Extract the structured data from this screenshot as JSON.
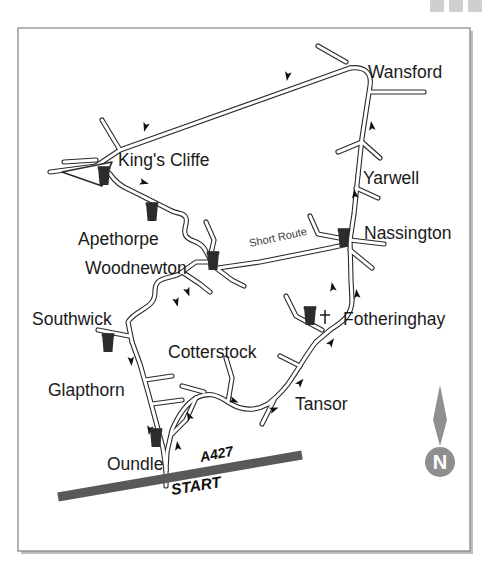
{
  "page": {
    "background_color": "#ffffff"
  },
  "decorations": {
    "top_bars": [
      {
        "name": "gray-bar-1",
        "color": "#cfcfcf"
      },
      {
        "name": "gray-bar-2",
        "color": "#cfcfcf"
      },
      {
        "name": "gray-bar-3",
        "color": "#cfcfcf"
      }
    ],
    "frame": {
      "border_color": "#8a8a8a",
      "shadow_color": "#bdbdbd"
    }
  },
  "map": {
    "frame_label": "map-frame",
    "road_color": "#2b2b2b",
    "road_fill": "#ffffff",
    "pub_symbol_color": "#2e2b2b",
    "main_road_color": "#595959",
    "places": [
      {
        "id": "wansford",
        "label": "Wansford",
        "x": 368,
        "y": 78,
        "anchor": "start"
      },
      {
        "id": "kings-cliffe",
        "label": "King's Cliffe",
        "x": 118,
        "y": 166,
        "anchor": "start"
      },
      {
        "id": "yarwell",
        "label": "Yarwell",
        "x": 363,
        "y": 184,
        "anchor": "start"
      },
      {
        "id": "apethorpe",
        "label": "Apethorpe",
        "x": 78,
        "y": 245,
        "anchor": "start"
      },
      {
        "id": "nassington",
        "label": "Nassington",
        "x": 364,
        "y": 239,
        "anchor": "start"
      },
      {
        "id": "woodnewton",
        "label": "Woodnewton",
        "x": 85,
        "y": 274,
        "anchor": "start"
      },
      {
        "id": "southwick",
        "label": "Southwick",
        "x": 32,
        "y": 325,
        "anchor": "start"
      },
      {
        "id": "fotheringhay",
        "label": "Fotheringhay",
        "x": 343,
        "y": 325,
        "anchor": "start"
      },
      {
        "id": "cotterstock",
        "label": "Cotterstock",
        "x": 168,
        "y": 358,
        "anchor": "start"
      },
      {
        "id": "glapthorn",
        "label": "Glapthorn",
        "x": 48,
        "y": 396,
        "anchor": "start"
      },
      {
        "id": "tansor",
        "label": "Tansor",
        "x": 295,
        "y": 410,
        "anchor": "start"
      },
      {
        "id": "oundle",
        "label": "Oundle",
        "x": 107,
        "y": 470,
        "anchor": "start"
      }
    ],
    "annotations": {
      "short_route": {
        "label": "Short Route",
        "x": 250,
        "y": 247,
        "rotate": -12
      },
      "a427": {
        "label": "A427",
        "x": 201,
        "y": 462,
        "rotate": -11
      },
      "start": {
        "label": "START",
        "x": 172,
        "y": 495,
        "rotate": -9
      }
    },
    "compass": {
      "name": "north-compass",
      "letter": "N",
      "needle_color": "#8f8f8f",
      "circle_color": "#8f8f8f",
      "x": 440,
      "y": 430
    },
    "pubs": [
      {
        "id": "pub-kings-cliffe",
        "x": 104,
        "y": 178
      },
      {
        "id": "pub-apethorpe",
        "x": 152,
        "y": 214
      },
      {
        "id": "pub-woodnewton",
        "x": 213,
        "y": 263
      },
      {
        "id": "pub-nassington",
        "x": 344,
        "y": 240
      },
      {
        "id": "pub-fotheringhay",
        "x": 310,
        "y": 318
      },
      {
        "id": "pub-southwick",
        "x": 108,
        "y": 345
      },
      {
        "id": "pub-oundle",
        "x": 156,
        "y": 440
      }
    ],
    "church": {
      "id": "church-fotheringhay",
      "x": 325,
      "y": 318,
      "symbol": "cross"
    },
    "direction_arrows": [
      {
        "id": "arrow-top-east",
        "x": 288,
        "y": 74,
        "rotate": 190
      },
      {
        "id": "arrow-top-west",
        "x": 146,
        "y": 125,
        "rotate": 196
      },
      {
        "id": "arrow-kc-east",
        "x": 140,
        "y": 182,
        "rotate": 10
      },
      {
        "id": "arrow-apethorpe",
        "x": 187,
        "y": 290,
        "rotate": 120
      },
      {
        "id": "arrow-wansford-n",
        "x": 372,
        "y": 128,
        "rotate": -15
      },
      {
        "id": "arrow-yarwell-n",
        "x": 355,
        "y": 196,
        "rotate": -8
      },
      {
        "id": "arrow-nassington-n",
        "x": 357,
        "y": 296,
        "rotate": -8
      },
      {
        "id": "arrow-southwick",
        "x": 176,
        "y": 300,
        "rotate": 120
      },
      {
        "id": "arrow-glapthorn-s",
        "x": 131,
        "y": 359,
        "rotate": 170
      },
      {
        "id": "arrow-glapthorn-s2",
        "x": 165,
        "y": 422,
        "rotate": 160
      },
      {
        "id": "arrow-oundle-n",
        "x": 180,
        "y": 448,
        "rotate": -5
      },
      {
        "id": "arrow-cotterstock",
        "x": 196,
        "y": 418,
        "rotate": -35
      },
      {
        "id": "arrow-cotterstock2",
        "x": 233,
        "y": 402,
        "rotate": 60
      },
      {
        "id": "arrow-tansor-e",
        "x": 272,
        "y": 410,
        "rotate": 35
      },
      {
        "id": "arrow-tansor-ne",
        "x": 299,
        "y": 384,
        "rotate": -35
      },
      {
        "id": "arrow-fotheringhay",
        "x": 330,
        "y": 344,
        "rotate": -35
      },
      {
        "id": "arrow-fother-ne",
        "x": 333,
        "y": 289,
        "rotate": -20
      }
    ]
  }
}
